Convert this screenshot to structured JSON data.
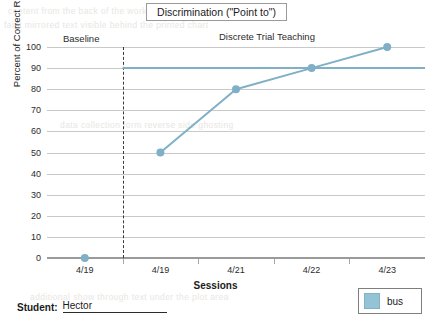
{
  "chart_data": {
    "type": "line",
    "title": "Discrimination (\"Point to\")",
    "xlabel": "Sessions",
    "ylabel": "Percent of Correct Responses",
    "categories": [
      "4/19",
      "4/19",
      "4/21",
      "4/22",
      "4/23"
    ],
    "series": [
      {
        "name": "bus",
        "values": [
          0,
          50,
          80,
          90,
          100
        ],
        "color": "#7fb0c6"
      }
    ],
    "ylim": [
      0,
      100
    ],
    "yticks": [
      0,
      10,
      20,
      30,
      40,
      50,
      60,
      70,
      80,
      90,
      100
    ],
    "ytick_labels": [
      "0",
      "10",
      "20",
      "30",
      "40",
      "50",
      "60",
      "70",
      "80",
      "90",
      "100"
    ],
    "grid": true,
    "legend_position": "bottom-right",
    "goal_line": {
      "label": "",
      "value": 90,
      "color": "#7fb0c6",
      "starts_at_phase_change": true
    },
    "phases": [
      {
        "label": "Baseline",
        "sessions": [
          "4/19"
        ]
      },
      {
        "label": "Discrete Trial Teaching",
        "sessions": [
          "4/19",
          "4/21",
          "4/22",
          "4/23"
        ]
      }
    ],
    "phase_change_line": {
      "style": "dashed",
      "color": "#3a3a3a",
      "after_index": 0
    }
  },
  "legend": {
    "swatch_name": "bus-color-swatch",
    "label": "bus"
  },
  "footer": {
    "student_label": "Student:",
    "student_name": "Hector"
  },
  "bleed_text": {
    "line1": "content from the back of the worksheet showing through",
    "line2": "faint mirrored text visible behind the printed chart",
    "line3": "data collection form reverse side ghosting",
    "line4": "additional show through text under the plot area"
  }
}
